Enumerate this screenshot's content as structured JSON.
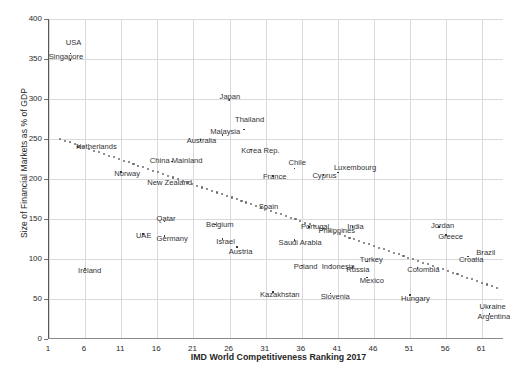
{
  "chart_data": {
    "type": "scatter",
    "title": "",
    "xlabel": "IMD World Competitiveness Ranking 2017",
    "ylabel": "Size of Financial Markets as % of GDP",
    "xlim": [
      1,
      64
    ],
    "ylim": [
      0,
      400
    ],
    "xticks": [
      "1",
      "6",
      "11",
      "16",
      "21",
      "26",
      "31",
      "36",
      "41",
      "46",
      "51",
      "56",
      "61"
    ],
    "xtick_values": [
      1,
      6,
      11,
      16,
      21,
      26,
      31,
      36,
      41,
      46,
      51,
      56,
      61
    ],
    "yticks": [
      "0",
      "50",
      "100",
      "150",
      "200",
      "250",
      "300",
      "350",
      "400"
    ],
    "ytick_values": [
      0,
      50,
      100,
      150,
      200,
      250,
      300,
      350,
      400
    ],
    "grid": "both",
    "legend": "none",
    "marker_color": "#3a3a3c",
    "trendline_color": "#6b6b6e",
    "trendline": {
      "style": "dotted",
      "x_start": 2.5,
      "y_start": 250,
      "x_end": 63,
      "y_end": 64
    },
    "points": [
      {
        "label": "USA",
        "x": 4,
        "y": 357,
        "lx": -5,
        "ly": -10
      },
      {
        "label": "Singapore",
        "x": 4,
        "y": 349,
        "lx": -22,
        "ly": -3
      },
      {
        "label": "Japan",
        "x": 26,
        "y": 299,
        "lx": -10,
        "ly": -3
      },
      {
        "label": "Thailand",
        "x": 28,
        "y": 262,
        "lx": -9,
        "ly": -9
      },
      {
        "label": "Malaysia",
        "x": 25,
        "y": 255,
        "lx": -12,
        "ly": -3
      },
      {
        "label": "Australia",
        "x": 22,
        "y": 249,
        "lx": -14,
        "ly": 1
      },
      {
        "label": "Netherlands",
        "x": 5,
        "y": 240,
        "lx": -2,
        "ly": 0
      },
      {
        "label": "Korea Rep.",
        "x": 29,
        "y": 237,
        "lx": -10,
        "ly": 2
      },
      {
        "label": "China Mainland",
        "x": 18,
        "y": 222,
        "lx": -22,
        "ly": 0
      },
      {
        "label": "Chile",
        "x": 35,
        "y": 213,
        "lx": -6,
        "ly": -6
      },
      {
        "label": "Luxembourg",
        "x": 41,
        "y": 208,
        "lx": -4,
        "ly": -5
      },
      {
        "label": "Norway",
        "x": 11,
        "y": 209,
        "lx": -7,
        "ly": 2
      },
      {
        "label": "Cyprus",
        "x": 39,
        "y": 205,
        "lx": -11,
        "ly": 1
      },
      {
        "label": "France",
        "x": 32,
        "y": 204,
        "lx": -10,
        "ly": 1
      },
      {
        "label": "New Zealand",
        "x": 16,
        "y": 197,
        "lx": -10,
        "ly": 2
      },
      {
        "label": "Spain",
        "x": 31,
        "y": 167,
        "lx": -7,
        "ly": 2
      },
      {
        "label": "Qatar",
        "x": 17,
        "y": 147,
        "lx": -8,
        "ly": -2
      },
      {
        "label": "Belgium",
        "x": 24,
        "y": 143,
        "lx": -9,
        "ly": 0
      },
      {
        "label": "Portugal",
        "x": 37,
        "y": 140,
        "lx": -8,
        "ly": 0
      },
      {
        "label": "Philippines",
        "x": 39,
        "y": 138,
        "lx": -5,
        "ly": 2
      },
      {
        "label": "India",
        "x": 43,
        "y": 140,
        "lx": -5,
        "ly": 0
      },
      {
        "label": "Jordan",
        "x": 55,
        "y": 140,
        "lx": -8,
        "ly": -1
      },
      {
        "label": "UAE",
        "x": 14,
        "y": 131,
        "lx": -7,
        "ly": 2
      },
      {
        "label": "Germany",
        "x": 17,
        "y": 129,
        "lx": -8,
        "ly": 3
      },
      {
        "label": "Greece",
        "x": 56,
        "y": 130,
        "lx": -8,
        "ly": 2
      },
      {
        "label": "Israel",
        "x": 25,
        "y": 125,
        "lx": -6,
        "ly": 3
      },
      {
        "label": "Saudi Arabia",
        "x": 35,
        "y": 124,
        "lx": -16,
        "ly": 3
      },
      {
        "label": "Austria",
        "x": 27,
        "y": 115,
        "lx": -8,
        "ly": 5
      },
      {
        "label": "Brazil",
        "x": 61,
        "y": 108,
        "lx": -6,
        "ly": 0
      },
      {
        "label": "Croatia",
        "x": 59,
        "y": 103,
        "lx": -9,
        "ly": 3
      },
      {
        "label": "Poland",
        "x": 36,
        "y": 92,
        "lx": -8,
        "ly": 2
      },
      {
        "label": "Indonesia",
        "x": 40,
        "y": 92,
        "lx": -9,
        "ly": 2
      },
      {
        "label": "Russia",
        "x": 43,
        "y": 90,
        "lx": -6,
        "ly": 3
      },
      {
        "label": "Turkey",
        "x": 45,
        "y": 97,
        "lx": -7,
        "ly": -1
      },
      {
        "label": "Colombia",
        "x": 52,
        "y": 89,
        "lx": -10,
        "ly": 2
      },
      {
        "label": "Ireland",
        "x": 6,
        "y": 88,
        "lx": -7,
        "ly": 2
      },
      {
        "label": "Mexico",
        "x": 45,
        "y": 77,
        "lx": -7,
        "ly": 4
      },
      {
        "label": "Kazakhstan",
        "x": 32,
        "y": 59,
        "lx": -13,
        "ly": 3
      },
      {
        "label": "Slovenia",
        "x": 40,
        "y": 57,
        "lx": -10,
        "ly": 4
      },
      {
        "label": "Hungary",
        "x": 51,
        "y": 55,
        "lx": -9,
        "ly": 4
      },
      {
        "label": "Ukraine",
        "x": 62,
        "y": 40,
        "lx": -10,
        "ly": 0
      },
      {
        "label": "Argentina",
        "x": 62,
        "y": 31,
        "lx": -12,
        "ly": 3
      }
    ]
  }
}
